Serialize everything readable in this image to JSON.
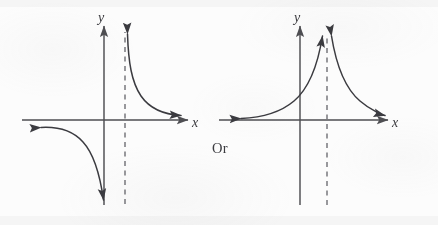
{
  "figure": {
    "connector_label": "Or",
    "background_color": "#fcfcfc",
    "ink_color": "#3b3b40",
    "axis_color": "#4e4e52",
    "asymptote_color": "#77777c"
  },
  "graphs": [
    {
      "id": "left",
      "name": "odd-asymptote-graph",
      "description": "Rational curve with a vertical asymptote right of the y-axis; upper branch on the right falls from plus infinity toward the x-axis, lower branch on the left crosses the y-axis and falls to minus infinity.",
      "x_axis_label": "x",
      "y_axis_label": "y",
      "asymptote": {
        "type": "vertical",
        "label": "",
        "style": "dashed"
      },
      "branches": [
        {
          "name": "upper-right-branch",
          "from": "plus-infinity-at-asymptote",
          "to": "x-axis-right",
          "arrow_start": true,
          "arrow_end": true
        },
        {
          "name": "lower-left-branch",
          "from": "x-axis-left",
          "to": "minus-infinity-at-asymptote",
          "arrow_start": true,
          "arrow_end": true
        }
      ]
    },
    {
      "id": "right",
      "name": "even-asymptote-graph",
      "description": "Rational curve with a vertical asymptote right of the y-axis; both branches rise to plus infinity at the asymptote and flatten toward the x-axis on each side.",
      "x_axis_label": "x",
      "y_axis_label": "y",
      "asymptote": {
        "type": "vertical",
        "label": "",
        "style": "dashed"
      },
      "branches": [
        {
          "name": "left-branch",
          "from": "x-axis-left",
          "to": "plus-infinity-at-asymptote",
          "arrow_start": true,
          "arrow_end": true
        },
        {
          "name": "right-branch",
          "from": "plus-infinity-at-asymptote",
          "to": "x-axis-right",
          "arrow_start": true,
          "arrow_end": true
        }
      ]
    }
  ]
}
